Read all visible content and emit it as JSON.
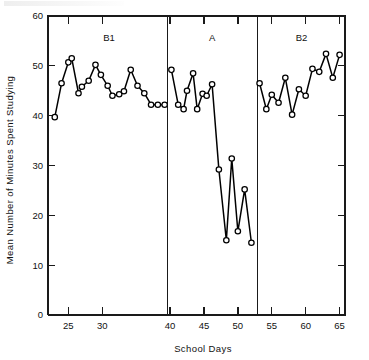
{
  "chart_data": {
    "type": "line",
    "title": "",
    "xlabel": "School Days",
    "ylabel": "Mean Number of Minutes Spent Studying",
    "xlim": [
      22,
      65.8
    ],
    "ylim": [
      0,
      60
    ],
    "xticks": [
      25,
      30,
      40,
      45,
      50,
      55,
      60,
      65
    ],
    "yticks": [
      0,
      10,
      20,
      30,
      40,
      50,
      60
    ],
    "grid": false,
    "legend": "none",
    "marker": "open-circle",
    "phases": [
      {
        "label": "B1",
        "x_start": 22.6,
        "x_end": 39.6,
        "label_x": 31.0,
        "label_y": 55.0
      },
      {
        "label": "A",
        "x_start": 39.6,
        "x_end": 52.9,
        "label_x": 46.2,
        "label_y": 55.0
      },
      {
        "label": "B2",
        "x_start": 52.9,
        "x_end": 65.8,
        "label_x": 59.4,
        "label_y": 55.0
      }
    ],
    "phase_dividers": [
      39.6,
      52.9
    ],
    "series": [
      {
        "name": "Mean minutes studying",
        "segments": [
          {
            "phase": "B1",
            "x": [
              23,
              24,
              25,
              25.5,
              26.5,
              27,
              28,
              29,
              29.8,
              30.8,
              31.5,
              32.5,
              33.2,
              34.2,
              35.2,
              36.2,
              37.2,
              38.2,
              39.2
            ],
            "y": [
              39.7,
              46.5,
              50.7,
              51.5,
              44.5,
              45.8,
              47.0,
              50.2,
              48.2,
              46.0,
              44.0,
              44.3,
              44.9,
              49.2,
              46.0,
              44.5,
              42.2,
              42.2,
              42.2
            ]
          },
          {
            "phase": "A",
            "x": [
              40.2,
              41.2,
              42.0,
              42.5,
              43.4,
              44.0,
              44.8,
              45.4,
              46.2,
              47.2,
              48.3,
              49.1,
              50.0,
              51.0,
              52.0
            ],
            "y": [
              49.2,
              42.2,
              41.3,
              45.0,
              48.5,
              41.3,
              44.4,
              44.0,
              46.3,
              29.2,
              15.0,
              31.4,
              16.8,
              25.2,
              14.5
            ]
          },
          {
            "phase": "B2",
            "x": [
              53.2,
              54.2,
              55.0,
              56.0,
              57.0,
              58.0,
              59.0,
              60.0,
              61.0,
              62.0,
              63.0,
              64.0,
              65.0
            ],
            "y": [
              46.5,
              41.3,
              44.2,
              42.6,
              47.6,
              40.2,
              45.3,
              44.0,
              49.4,
              48.8,
              52.4,
              47.6,
              52.2
            ]
          }
        ]
      }
    ]
  },
  "axis_labels": {
    "x_title": "School Days",
    "y_title": "Mean Number of Minutes Spent Studying",
    "x_tick_text": [
      "25",
      "30",
      "40",
      "45",
      "50",
      "55",
      "60",
      "65"
    ],
    "y_tick_text": [
      "0",
      "10",
      "20",
      "30",
      "40",
      "50",
      "60"
    ]
  },
  "phase_label_text": {
    "b1": "B1",
    "a": "A",
    "b2": "B2"
  }
}
